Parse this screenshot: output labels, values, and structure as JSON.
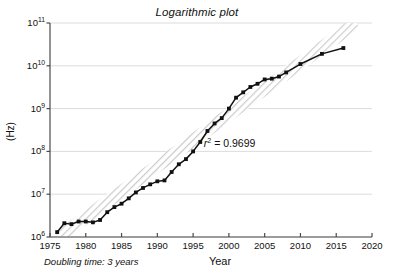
{
  "chart_data": {
    "type": "line",
    "title": "Logarithmic plot",
    "xlabel": "Year",
    "ylabel": "(Hz)",
    "yscale": "log",
    "xlim": [
      1975,
      2020
    ],
    "ylim": [
      1000000,
      100000000000
    ],
    "grid": "horizontal",
    "legend": "none",
    "xticks": [
      "1975",
      "1980",
      "1985",
      "1990",
      "1995",
      "2000",
      "2005",
      "2010",
      "2015",
      "2020"
    ],
    "xtick_values": [
      1975,
      1980,
      1985,
      1990,
      1995,
      2000,
      2005,
      2010,
      2015,
      2020
    ],
    "yticks": [
      "10<sup>6</sup>",
      "10<sup>7</sup>",
      "10<sup>8</sup>",
      "10<sup>9</sup>",
      "10<sup>10</sup>",
      "10<sup>11</sup>"
    ],
    "ytick_values": [
      1000000,
      10000000,
      100000000,
      1000000000,
      10000000000,
      100000000000
    ],
    "annotations": [
      {
        "name": "r-squared",
        "text_html": "<i>r</i><sup>2</sup> = 0.9699",
        "text": "r2 = 0.9699",
        "x": 1996.5,
        "y": 150000000
      },
      {
        "name": "doubling-time",
        "text": "Doubling time: 3 years"
      }
    ],
    "series": [
      {
        "name": "clock-frequency",
        "color": "#111111",
        "marker": "square",
        "x": [
          1976,
          1977,
          1978,
          1979,
          1980,
          1981,
          1982,
          1983,
          1984,
          1985,
          1986,
          1987,
          1988,
          1989,
          1990,
          1991,
          1992,
          1993,
          1994,
          1995,
          1996,
          1997,
          1998,
          1999,
          2000,
          2001,
          2002,
          2003,
          2004,
          2005,
          2006,
          2007,
          2008,
          2010,
          2013,
          2016
        ],
        "y": [
          1300000,
          2100000,
          2000000,
          2300000,
          2300000,
          2200000,
          2500000,
          3800000,
          5000000,
          6000000,
          8000000,
          11000000,
          14000000,
          17000000,
          20000000,
          21000000,
          33000000,
          50000000,
          66000000,
          100000000,
          166000000,
          300000000,
          450000000,
          600000000,
          1000000000,
          1800000000,
          2400000000,
          3200000000,
          3800000000,
          4800000000,
          5000000000,
          5600000000,
          7000000000,
          11000000000,
          19000000000,
          26000000000
        ]
      }
    ],
    "trend_band": {
      "name": "doubling-time-band",
      "color": "#cccccc",
      "style": "diagonal-hatch",
      "x_start": 1976.2,
      "y_start": 1000000,
      "x_end": 2017.8,
      "y_end": 100000000000
    }
  }
}
